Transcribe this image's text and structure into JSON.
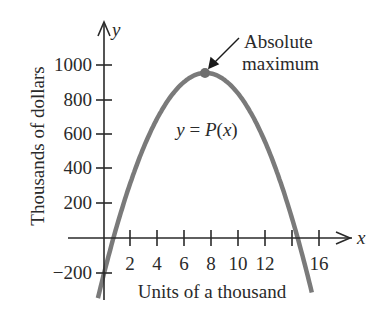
{
  "chart_data": {
    "type": "line",
    "title": "",
    "xlabel": "Units of a thousand",
    "ylabel": "Thousands of dollars",
    "x_axis_name": "x",
    "y_axis_name": "y",
    "xticks": [
      2,
      4,
      6,
      8,
      10,
      12,
      14,
      16
    ],
    "xtick_labels": [
      "2",
      "4",
      "6",
      "8",
      "10",
      "12",
      "",
      "16"
    ],
    "yticks": [
      -200,
      200,
      400,
      600,
      800,
      1000
    ],
    "ytick_labels": [
      "−200",
      "200",
      "400",
      "600",
      "800",
      "1000"
    ],
    "xlim": [
      -1,
      18
    ],
    "ylim": [
      -350,
      1200
    ],
    "grid": false,
    "series": [
      {
        "name": "y = P(x)",
        "color": "#7a7a7a",
        "x": [
          -0.5,
          0,
          0.7,
          2,
          4,
          6,
          7.55,
          8,
          10,
          12,
          14,
          14.4,
          15.5
        ],
        "y": [
          -420,
          -203,
          0,
          330,
          690,
          894,
          943,
          939,
          828,
          563,
          148,
          0,
          -380
        ]
      }
    ],
    "annotations": [
      {
        "text": "y = P(x)",
        "x": 7.5,
        "y": 620
      },
      {
        "text": "Absolute maximum",
        "lines": [
          "Absolute",
          "maximum"
        ],
        "points_to": [
          7.55,
          943
        ]
      }
    ]
  },
  "labels": {
    "curve": "y = P(x)",
    "annotation_line1": "Absolute",
    "annotation_line2": "maximum",
    "x_name": "x",
    "y_name": "y",
    "xlabel": "Units of a thousand",
    "ylabel": "Thousands of dollars",
    "y1000": "1000",
    "y800": "800",
    "y600": "600",
    "y400": "400",
    "y200": "200",
    "yneg200": "−200",
    "x2": "2",
    "x4": "4",
    "x6": "6",
    "x8": "8",
    "x10": "10",
    "x12": "12",
    "x16": "16"
  }
}
